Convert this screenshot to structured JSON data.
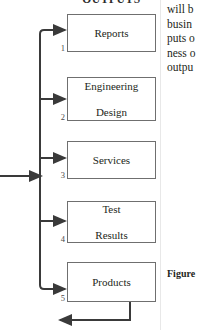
{
  "diagram": {
    "title": "OUTPUTS",
    "boxes": [
      {
        "number": "1",
        "label": "Reports"
      },
      {
        "number": "2",
        "label": "Engineering\nDesign"
      },
      {
        "number": "3",
        "label": "Services"
      },
      {
        "number": "4",
        "label": "Test\nResults"
      },
      {
        "number": "5",
        "label": "Products"
      }
    ],
    "box_labels": {
      "one": "Reports",
      "two_line1": "Engineering",
      "two_line2": "Design",
      "three": "Services",
      "four_line1": "Test",
      "four_line2": "Results",
      "five": "Products"
    },
    "numbers": {
      "one": "1",
      "two": "2",
      "three": "3",
      "four": "4",
      "five": "5"
    },
    "colors": {
      "box_border": "#6f6f6f",
      "connector": "#3a3a3a",
      "text": "#231f20",
      "background": "#ffffff"
    }
  },
  "body_text": {
    "lines": [
      "will b",
      "busin",
      "puts o",
      "ness o",
      "outpu"
    ],
    "line_1": "will b",
    "line_2": "busin",
    "line_3": "puts o",
    "line_4": "ness o",
    "line_5": "outpu"
  },
  "caption": {
    "text": "Figure"
  }
}
